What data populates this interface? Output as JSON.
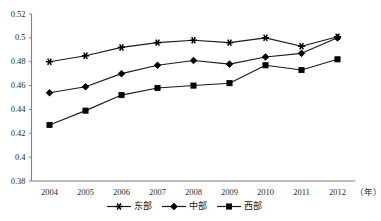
{
  "chart_data": {
    "type": "line",
    "title": "",
    "subtitle": "",
    "xlabel": "（年）",
    "ylabel": "",
    "categories": [
      "2004",
      "2005",
      "2006",
      "2007",
      "2008",
      "2009",
      "2010",
      "2011",
      "2012"
    ],
    "series": [
      {
        "name": "东部",
        "marker": "star",
        "color": "#000000",
        "values": [
          0.48,
          0.485,
          0.492,
          0.496,
          0.498,
          0.496,
          0.5,
          0.493,
          0.501
        ]
      },
      {
        "name": "中部",
        "marker": "diamond",
        "color": "#000000",
        "values": [
          0.454,
          0.459,
          0.47,
          0.477,
          0.481,
          0.478,
          0.484,
          0.487,
          0.5
        ]
      },
      {
        "name": "西部",
        "marker": "square",
        "color": "#000000",
        "values": [
          0.427,
          0.439,
          0.452,
          0.458,
          0.46,
          0.462,
          0.477,
          0.473,
          0.482
        ]
      }
    ],
    "ylim": [
      0.38,
      0.52
    ],
    "ytick_labels": [
      "0.52",
      "0.5",
      "0.48",
      "0.46",
      "0.44",
      "0.42",
      "0.4",
      "0.38"
    ],
    "ytick_values": [
      0.52,
      0.5,
      0.48,
      0.46,
      0.44,
      0.42,
      0.4,
      0.38
    ],
    "grid": false,
    "legend_position": "bottom",
    "line_color": "#1a1a1a",
    "axis_color": "#808080"
  }
}
